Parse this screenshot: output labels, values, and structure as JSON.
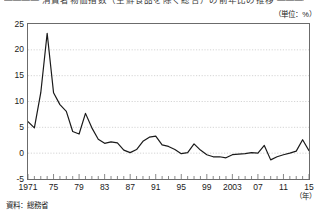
{
  "title": "―――― 消費者物価指数（生鮮食品を除く総合）の前年比の推移 ――――",
  "unit_note": "（単位：%）",
  "year_axis_note": "（年）",
  "source_note": "資料：総務省",
  "axis": {
    "y_ticks": [
      "25",
      "20",
      "15",
      "10",
      "5",
      "0",
      "-5"
    ],
    "x_ticks": [
      "1971",
      "75",
      "79",
      "83",
      "87",
      "91",
      "95",
      "99",
      "2003",
      "07",
      "11",
      "15"
    ]
  },
  "chart_data": {
    "type": "line",
    "xlabel": "（年）",
    "ylabel": "（単位：%）",
    "ylim": [
      -5,
      25
    ],
    "xlim": [
      1971,
      2015
    ],
    "grid": true,
    "legend_position": "none",
    "line_color": "#1a1a1a",
    "x": [
      1971,
      1972,
      1973,
      1974,
      1975,
      1976,
      1977,
      1978,
      1979,
      1980,
      1981,
      1982,
      1983,
      1984,
      1985,
      1986,
      1987,
      1988,
      1989,
      1990,
      1991,
      1992,
      1993,
      1994,
      1995,
      1996,
      1997,
      1998,
      1999,
      2000,
      2001,
      2002,
      2003,
      2004,
      2005,
      2006,
      2007,
      2008,
      2009,
      2010,
      2011,
      2012,
      2013,
      2014,
      2015
    ],
    "values": [
      6.1,
      4.9,
      11.7,
      23.2,
      11.7,
      9.4,
      8.1,
      4.2,
      3.7,
      7.7,
      4.9,
      2.7,
      1.9,
      2.2,
      2.0,
      0.6,
      0.1,
      0.7,
      2.3,
      3.1,
      3.3,
      1.6,
      1.3,
      0.7,
      -0.1,
      0.1,
      1.8,
      0.6,
      -0.3,
      -0.7,
      -0.7,
      -0.9,
      -0.3,
      -0.2,
      -0.1,
      0.1,
      0.0,
      1.5,
      -1.3,
      -0.7,
      -0.3,
      0.0,
      0.4,
      2.6,
      0.5
    ],
    "x_tick_values": [
      1971,
      1975,
      1979,
      1983,
      1987,
      1991,
      1995,
      1999,
      2003,
      2007,
      2011,
      2015
    ],
    "y_tick_values": [
      25,
      20,
      15,
      10,
      5,
      0,
      -5
    ]
  }
}
